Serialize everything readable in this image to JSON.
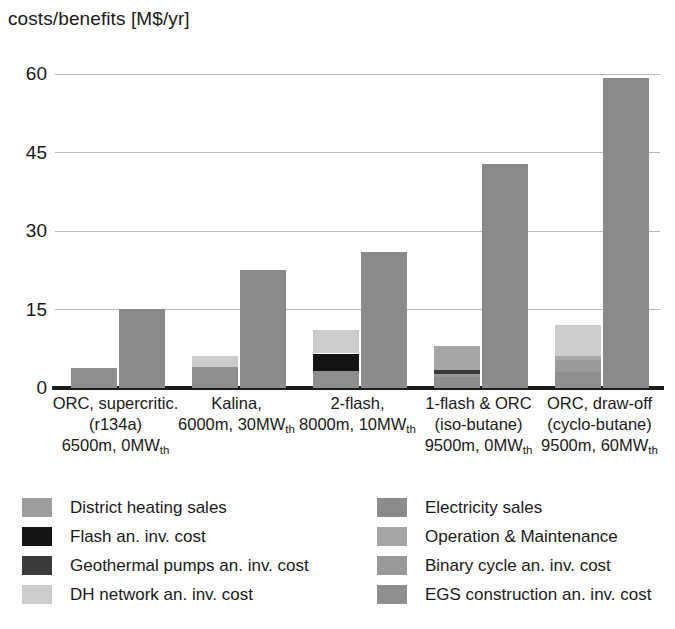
{
  "chart_data": {
    "type": "bar",
    "title": "costs/benefits [M$/yr]",
    "xlabel": "",
    "ylabel": "costs/benefits [M$/yr]",
    "ylim": [
      0,
      65
    ],
    "yticks": [
      0,
      15,
      30,
      45,
      60
    ],
    "ytick_labels": [
      "0",
      "15",
      "30",
      "45",
      "60"
    ],
    "grid": "horizontal",
    "legend_position": "below",
    "stacked": true,
    "paired": "cost bar (left) vs revenue bar (right) per category",
    "categories": [
      {
        "line1": "ORC, supercritic.",
        "line2": "(r134a)",
        "line3_pre": "6500m, 0MW",
        "line3_sub": "th"
      },
      {
        "line1": "Kalina,",
        "line2_pre": "6000m, 30MW",
        "line2_sub": "th",
        "line3_pre": "",
        "line3_sub": ""
      },
      {
        "line1": "2-flash,",
        "line2_pre": "8000m, 10MW",
        "line2_sub": "th",
        "line3_pre": "",
        "line3_sub": ""
      },
      {
        "line1": "1-flash & ORC",
        "line2": "(iso-butane)",
        "line3_pre": "9500m, 0MW",
        "line3_sub": "th"
      },
      {
        "line1": "ORC, draw-off",
        "line2": "(cyclo-butane)",
        "line3_pre": "9500m, 60MW",
        "line3_sub": "th"
      }
    ],
    "series": [
      {
        "name": "EGS construction an. inv. cost",
        "color": "#8e8e8e",
        "stack": "cost",
        "values": [
          3.9,
          4.0,
          3.3,
          2.1,
          3.0
        ]
      },
      {
        "name": "Binary cycle an. inv. cost",
        "color": "#9a9a9a",
        "stack": "cost",
        "values": [
          0.0,
          0.0,
          0.0,
          0.6,
          2.3
        ]
      },
      {
        "name": "Geothermal pumps an. inv. cost",
        "color": "#3a3a3a",
        "stack": "cost",
        "values": [
          0.0,
          0.0,
          0.0,
          0.7,
          0.0
        ]
      },
      {
        "name": "Flash an. inv. cost",
        "color": "#141414",
        "stack": "cost",
        "values": [
          0.0,
          0.0,
          3.3,
          0.0,
          0.0
        ]
      },
      {
        "name": "Operation & Maintenance",
        "color": "#a6a6a6",
        "stack": "cost",
        "values": [
          0.0,
          0.0,
          0.0,
          4.7,
          0.9
        ]
      },
      {
        "name": "DH network an. inv. cost",
        "color": "#cccccc",
        "stack": "cost",
        "values": [
          0.0,
          2.1,
          4.4,
          0.0,
          5.9
        ]
      },
      {
        "name": "Electricity sales",
        "color": "#8a8a8a",
        "stack": "revenue",
        "values": [
          15.2,
          22.5,
          26.0,
          42.8,
          59.2
        ]
      },
      {
        "name": "District heating sales",
        "color": "#9d9d9d",
        "stack": "revenue",
        "values": [
          0.0,
          0.0,
          0.0,
          0.0,
          0.0
        ]
      }
    ],
    "cost_totals": [
      3.9,
      6.1,
      11.0,
      8.1,
      12.1
    ],
    "revenue_totals": [
      15.2,
      22.5,
      26.0,
      42.8,
      59.2
    ],
    "annotations": []
  },
  "legend": {
    "left_column": [
      {
        "label": "District heating sales",
        "color": "#9d9d9d"
      },
      {
        "label": "Flash an. inv. cost",
        "color": "#141414"
      },
      {
        "label": "Geothermal pumps an. inv. cost",
        "color": "#3a3a3a"
      },
      {
        "label": "DH network an. inv. cost",
        "color": "#cccccc"
      }
    ],
    "right_column": [
      {
        "label": "Electricity sales",
        "color": "#8a8a8a"
      },
      {
        "label": "Operation & Maintenance",
        "color": "#a6a6a6"
      },
      {
        "label": "Binary cycle an. inv. cost",
        "color": "#9a9a9a"
      },
      {
        "label": "EGS construction an. inv. cost",
        "color": "#8e8e8e"
      }
    ]
  }
}
